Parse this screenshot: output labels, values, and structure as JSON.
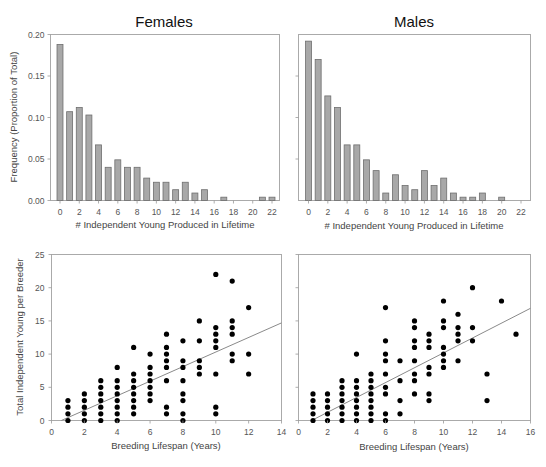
{
  "chart_data": [
    {
      "id": "females-histogram",
      "type": "bar",
      "title": "Females",
      "xlabel": "# Independent Young Produced in Lifetime",
      "ylabel": "Frequency (Proportion of Total)",
      "ylim": [
        0,
        0.2
      ],
      "yticks": [
        "0.00",
        "0.05",
        "0.10",
        "0.15",
        "0.20"
      ],
      "xticks": [
        "0",
        "2",
        "4",
        "6",
        "8",
        "10",
        "12",
        "14",
        "16",
        "18",
        "20",
        "22"
      ],
      "categories": [
        0,
        1,
        2,
        3,
        4,
        5,
        6,
        7,
        8,
        9,
        10,
        11,
        12,
        13,
        14,
        15,
        16,
        17,
        18,
        19,
        20,
        21,
        22
      ],
      "values": [
        0.188,
        0.107,
        0.112,
        0.103,
        0.067,
        0.04,
        0.049,
        0.04,
        0.04,
        0.027,
        0.022,
        0.022,
        0.013,
        0.022,
        0.009,
        0.013,
        0,
        0.004,
        0,
        0,
        0,
        0.004,
        0.004
      ],
      "grid": false
    },
    {
      "id": "males-histogram",
      "type": "bar",
      "title": "Males",
      "xlabel": "# Independent Young Produced in Lifetime",
      "ylabel": "",
      "ylim": [
        0,
        0.2
      ],
      "xticks": [
        "0",
        "2",
        "4",
        "6",
        "8",
        "10",
        "12",
        "14",
        "16",
        "18",
        "20",
        "22"
      ],
      "categories": [
        0,
        1,
        2,
        3,
        4,
        5,
        6,
        7,
        8,
        9,
        10,
        11,
        12,
        13,
        14,
        15,
        16,
        17,
        18,
        19,
        20,
        21,
        22
      ],
      "values": [
        0.192,
        0.17,
        0.126,
        0.112,
        0.067,
        0.067,
        0.049,
        0.036,
        0.009,
        0.031,
        0.018,
        0.013,
        0.036,
        0.018,
        0.027,
        0.009,
        0.004,
        0.004,
        0.009,
        0,
        0.004,
        0,
        0
      ],
      "grid": false
    },
    {
      "id": "females-scatter",
      "type": "scatter",
      "xlabel": "Breeding Lifespan (Years)",
      "ylabel": "Total Independent Young per Breeder",
      "xlim": [
        0,
        14
      ],
      "ylim": [
        0,
        25
      ],
      "xticks": [
        "0",
        "2",
        "4",
        "6",
        "8",
        "10",
        "12",
        "14"
      ],
      "yticks": [
        "0",
        "5",
        "10",
        "15",
        "20",
        "25"
      ],
      "points": [
        [
          1,
          0
        ],
        [
          1,
          1
        ],
        [
          1,
          2
        ],
        [
          1,
          3
        ],
        [
          2,
          0
        ],
        [
          2,
          1
        ],
        [
          2,
          2
        ],
        [
          2,
          3
        ],
        [
          2,
          4
        ],
        [
          3,
          0
        ],
        [
          3,
          1
        ],
        [
          3,
          2
        ],
        [
          3,
          3
        ],
        [
          3,
          4
        ],
        [
          3,
          5
        ],
        [
          3,
          6
        ],
        [
          4,
          0
        ],
        [
          4,
          1
        ],
        [
          4,
          2
        ],
        [
          4,
          3
        ],
        [
          4,
          4
        ],
        [
          4,
          5
        ],
        [
          4,
          6
        ],
        [
          4,
          8
        ],
        [
          5,
          1
        ],
        [
          5,
          2
        ],
        [
          5,
          3
        ],
        [
          5,
          4
        ],
        [
          5,
          5
        ],
        [
          5,
          6
        ],
        [
          5,
          7
        ],
        [
          5,
          11
        ],
        [
          6,
          3
        ],
        [
          6,
          4
        ],
        [
          6,
          5
        ],
        [
          6,
          6
        ],
        [
          6,
          7
        ],
        [
          6,
          8
        ],
        [
          6,
          10
        ],
        [
          7,
          1
        ],
        [
          7,
          2
        ],
        [
          7,
          6
        ],
        [
          7,
          8
        ],
        [
          7,
          9
        ],
        [
          7,
          10
        ],
        [
          7,
          11
        ],
        [
          7,
          13
        ],
        [
          8,
          0
        ],
        [
          8,
          1
        ],
        [
          8,
          3
        ],
        [
          8,
          4
        ],
        [
          8,
          6
        ],
        [
          8,
          8
        ],
        [
          8,
          9
        ],
        [
          8,
          12
        ],
        [
          9,
          7
        ],
        [
          9,
          8
        ],
        [
          9,
          9
        ],
        [
          9,
          12
        ],
        [
          9,
          15
        ],
        [
          10,
          1
        ],
        [
          10,
          2
        ],
        [
          10,
          7
        ],
        [
          10,
          11
        ],
        [
          10,
          12
        ],
        [
          10,
          13
        ],
        [
          10,
          14
        ],
        [
          10,
          22
        ],
        [
          11,
          9
        ],
        [
          11,
          10
        ],
        [
          11,
          13
        ],
        [
          11,
          14
        ],
        [
          11,
          15
        ],
        [
          11,
          21
        ],
        [
          12,
          7
        ],
        [
          12,
          10
        ],
        [
          12,
          17
        ]
      ],
      "regression_line": {
        "x1": 0.6,
        "y1": 0,
        "x2": 14,
        "y2": 14.7
      },
      "grid": false
    },
    {
      "id": "males-scatter",
      "type": "scatter",
      "xlabel": "Breeding Lifespan (Years)",
      "ylabel": "",
      "xlim": [
        0,
        16
      ],
      "ylim": [
        0,
        25
      ],
      "xticks": [
        "0",
        "2",
        "4",
        "6",
        "8",
        "10",
        "12",
        "14",
        "16"
      ],
      "points": [
        [
          1,
          0
        ],
        [
          1,
          1
        ],
        [
          1,
          2
        ],
        [
          1,
          3
        ],
        [
          1,
          4
        ],
        [
          2,
          0
        ],
        [
          2,
          1
        ],
        [
          2,
          2
        ],
        [
          2,
          3
        ],
        [
          2,
          4
        ],
        [
          3,
          0
        ],
        [
          3,
          1
        ],
        [
          3,
          2
        ],
        [
          3,
          3
        ],
        [
          3,
          4
        ],
        [
          3,
          5
        ],
        [
          3,
          6
        ],
        [
          4,
          0
        ],
        [
          4,
          1
        ],
        [
          4,
          2
        ],
        [
          4,
          3
        ],
        [
          4,
          4
        ],
        [
          4,
          5
        ],
        [
          4,
          6
        ],
        [
          4,
          10
        ],
        [
          5,
          0
        ],
        [
          5,
          1
        ],
        [
          5,
          2
        ],
        [
          5,
          3
        ],
        [
          5,
          4
        ],
        [
          5,
          5
        ],
        [
          5,
          6
        ],
        [
          5,
          7
        ],
        [
          6,
          0
        ],
        [
          6,
          1
        ],
        [
          6,
          4
        ],
        [
          6,
          5
        ],
        [
          6,
          7
        ],
        [
          6,
          9
        ],
        [
          6,
          10
        ],
        [
          6,
          12
        ],
        [
          6,
          17
        ],
        [
          7,
          1
        ],
        [
          7,
          3
        ],
        [
          7,
          6
        ],
        [
          7,
          9
        ],
        [
          8,
          4
        ],
        [
          8,
          6
        ],
        [
          8,
          7
        ],
        [
          8,
          9
        ],
        [
          8,
          11
        ],
        [
          8,
          12
        ],
        [
          8,
          14
        ],
        [
          8,
          15
        ],
        [
          9,
          3
        ],
        [
          9,
          4
        ],
        [
          9,
          7
        ],
        [
          9,
          8
        ],
        [
          9,
          11
        ],
        [
          9,
          12
        ],
        [
          9,
          13
        ],
        [
          10,
          8
        ],
        [
          10,
          9
        ],
        [
          10,
          10
        ],
        [
          10,
          11
        ],
        [
          10,
          14
        ],
        [
          10,
          15
        ],
        [
          10,
          18
        ],
        [
          11,
          9
        ],
        [
          11,
          12
        ],
        [
          11,
          13
        ],
        [
          11,
          14
        ],
        [
          11,
          16
        ],
        [
          12,
          12
        ],
        [
          12,
          14
        ],
        [
          12,
          20
        ],
        [
          13,
          3
        ],
        [
          13,
          7
        ],
        [
          14,
          18
        ],
        [
          15,
          13
        ]
      ],
      "regression_line": {
        "x1": 0.9,
        "y1": 0,
        "x2": 16,
        "y2": 16.9
      },
      "grid": false
    }
  ],
  "labels": {
    "females_title": "Females",
    "males_title": "Males",
    "hist_xlabel": "# Independent Young Produced in Lifetime",
    "hist_ylabel": "Frequency (Proportion of Total)",
    "scatter_xlabel": "Breeding Lifespan (Years)",
    "scatter_ylabel": "Total Independent Young per Breeder"
  }
}
